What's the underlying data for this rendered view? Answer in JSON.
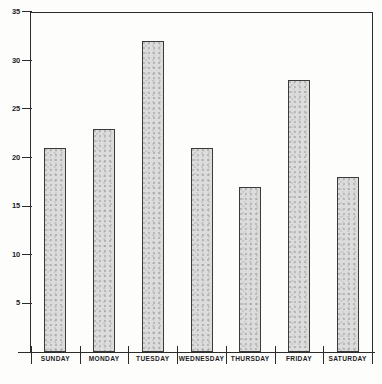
{
  "chart_data": {
    "type": "bar",
    "title": "",
    "subtitle": "",
    "xlabel": "",
    "ylabel": "",
    "categories": [
      "SUNDAY",
      "MONDAY",
      "TUESDAY",
      "WEDNESDAY",
      "THURSDAY",
      "FRIDAY",
      "SATURDAY"
    ],
    "values": [
      21,
      23,
      32,
      21,
      17,
      28,
      18
    ],
    "ylim": [
      0,
      35
    ],
    "ytick_values": [
      5,
      10,
      15,
      20,
      25,
      30,
      35
    ],
    "ytick_labels": [
      "5",
      "10",
      "15",
      "20",
      "25",
      "30",
      "35"
    ],
    "grid": false,
    "legend": null,
    "annotations": [],
    "colors": {
      "bar_fill": "#dcdcdc",
      "bar_border": "#3a3a3a",
      "axis": "#2b2b2b",
      "text": "#1c1c1c",
      "background": "#fdfdfc"
    }
  }
}
